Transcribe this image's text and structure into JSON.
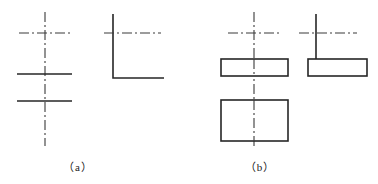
{
  "figure": {
    "background_color": "#ffffff",
    "line_color": "#262626",
    "centerline_color": "#3a3a3a",
    "solid_stroke_width": 1.6,
    "center_stroke_width": 1.1,
    "center_dash_pattern": "10 3 2 3",
    "panels": [
      {
        "id": "a",
        "caption": "（a）",
        "description": "incorrect centerline usage without object outlines",
        "views": [
          {
            "id": "a-front",
            "type": "centerline-cross-with-two-horizontal-lines",
            "center_vertical": {
              "x": 45,
              "y1": 12,
              "y2": 146
            },
            "center_horizontal": {
              "y": 33,
              "x1": 19,
              "x2": 71
            },
            "solid_horizontal_lines": [
              {
                "y": 74,
                "x1": 17,
                "x2": 72
              },
              {
                "y": 101,
                "x1": 17,
                "x2": 72
              }
            ]
          },
          {
            "id": "a-side",
            "type": "L-shape-with-horizontal-centerline",
            "solid_vertical": {
              "x": 113,
              "y1": 14,
              "y2": 78
            },
            "solid_horizontal": {
              "y": 78,
              "x1": 113,
              "x2": 164
            },
            "center_horizontal": {
              "y": 33,
              "x1": 104,
              "x2": 161
            }
          }
        ]
      },
      {
        "id": "b",
        "caption": "（b）",
        "description": "correct centerline usage on rectangular object outlines",
        "views": [
          {
            "id": "b-front-upper",
            "type": "rectangle",
            "rect": {
              "x": 221,
              "y": 59,
              "width": 67,
              "height": 17
            }
          },
          {
            "id": "b-front-lower",
            "type": "rectangle",
            "rect": {
              "x": 221,
              "y": 100,
              "width": 67,
              "height": 41
            }
          },
          {
            "id": "b-front-centerlines",
            "type": "centerline-cross",
            "center_vertical": {
              "x": 254,
              "y1": 12,
              "y2": 146
            },
            "center_horizontal": {
              "y": 33,
              "x1": 228,
              "x2": 280
            }
          },
          {
            "id": "b-side",
            "type": "rectangle-with-vertical-and-centerline",
            "rect": {
              "x": 308,
              "y": 59,
              "width": 59,
              "height": 17
            },
            "solid_vertical": {
              "x": 316,
              "y1": 14,
              "y2": 59
            },
            "center_horizontal": {
              "y": 33,
              "x1": 299,
              "x2": 357
            }
          }
        ]
      }
    ]
  }
}
